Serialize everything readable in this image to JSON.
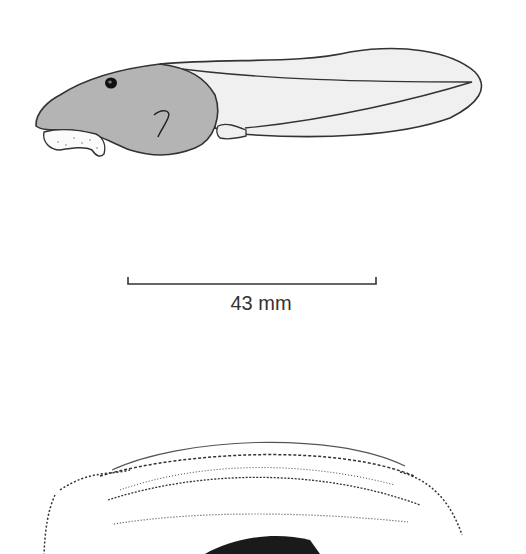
{
  "figure": {
    "tadpole": {
      "label": "tadpole-lateral-view",
      "body_color": "#b4b4b4",
      "tail_color": "#eeeeee",
      "outline_color": "#333333"
    },
    "scale_bar": {
      "label": "43 mm",
      "length_px": 248
    },
    "oral_disc": {
      "label": "oral-disc-view",
      "beak_color": "#1a1a1a"
    }
  }
}
